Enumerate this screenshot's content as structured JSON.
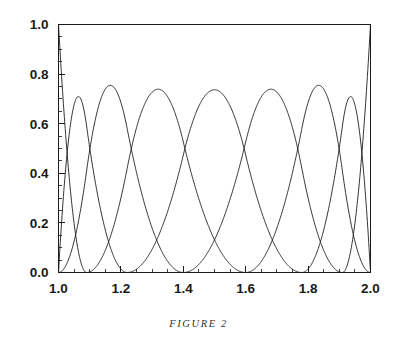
{
  "figure": {
    "caption": "FIGURE 2",
    "background_color": "#ffffff",
    "ink_color": "#111111"
  },
  "chart_data": {
    "type": "line",
    "title": "",
    "subtitle": "",
    "xlabel": "",
    "ylabel": "",
    "xlim": [
      1.0,
      2.0
    ],
    "ylim": [
      0.0,
      1.0
    ],
    "grid": false,
    "legend_position": "none",
    "x_ticks": [
      1.0,
      1.2,
      1.4,
      1.6,
      1.8,
      2.0
    ],
    "x_tick_labels": [
      "1.0",
      "1.2",
      "1.4",
      "1.6",
      "1.8",
      "2.0"
    ],
    "x_minor_tick_step": 0.05,
    "y_ticks": [
      0.0,
      0.2,
      0.4,
      0.6,
      0.8,
      1.0
    ],
    "y_tick_labels": [
      "0.0",
      "0.2",
      "0.4",
      "0.6",
      "0.8",
      "1.0"
    ],
    "y_minor_tick_step": 0.05,
    "series": [
      {
        "name": "basis-1",
        "peak_x": 1.0,
        "peak_y": 1.0,
        "support": [
          1.0,
          1.09
        ],
        "knots": [
          1.0,
          1.0,
          1.0,
          1.09
        ]
      },
      {
        "name": "basis-2",
        "peak_x": 1.09,
        "peak_y": 0.6,
        "support": [
          1.0,
          1.22
        ],
        "knots": [
          1.0,
          1.0,
          1.09,
          1.22
        ]
      },
      {
        "name": "basis-3",
        "peak_x": 1.225,
        "peak_y": 0.6,
        "support": [
          1.0,
          1.4
        ],
        "knots": [
          1.0,
          1.09,
          1.22,
          1.4
        ]
      },
      {
        "name": "basis-4",
        "peak_x": 1.405,
        "peak_y": 0.665,
        "support": [
          1.09,
          1.6
        ],
        "knots": [
          1.09,
          1.22,
          1.4,
          1.6
        ]
      },
      {
        "name": "basis-5",
        "peak_x": 1.6,
        "peak_y": 0.665,
        "support": [
          1.22,
          1.78
        ],
        "knots": [
          1.22,
          1.4,
          1.6,
          1.78
        ]
      },
      {
        "name": "basis-6",
        "peak_x": 1.782,
        "peak_y": 0.6,
        "support": [
          1.4,
          1.91
        ],
        "knots": [
          1.4,
          1.6,
          1.78,
          1.91
        ]
      },
      {
        "name": "basis-7",
        "peak_x": 1.908,
        "peak_y": 0.6,
        "support": [
          1.6,
          2.0
        ],
        "knots": [
          1.6,
          1.78,
          1.91,
          2.0
        ]
      },
      {
        "name": "basis-8",
        "peak_x": 2.0,
        "peak_y": 1.0,
        "support": [
          1.91,
          2.0
        ],
        "knots": [
          1.91,
          2.0,
          2.0,
          2.0
        ]
      }
    ]
  }
}
